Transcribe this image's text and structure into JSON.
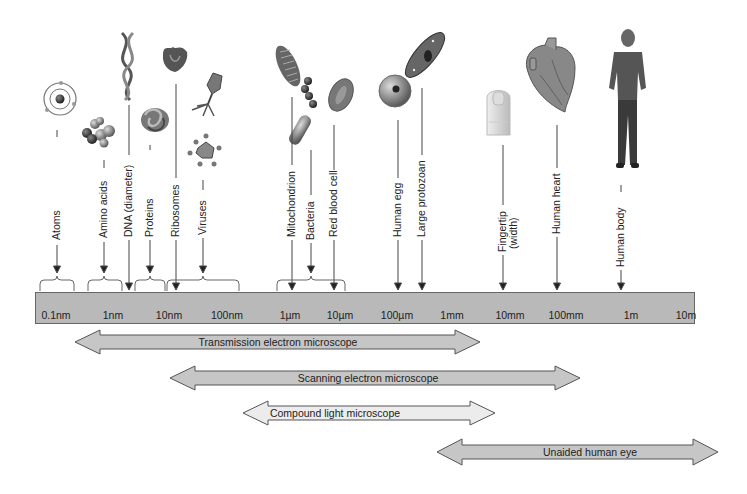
{
  "scale": {
    "ticks": [
      {
        "label": "0.1nm",
        "x": 56
      },
      {
        "label": "1nm",
        "x": 113
      },
      {
        "label": "10nm",
        "x": 169
      },
      {
        "label": "100nm",
        "x": 227
      },
      {
        "label": "1µm",
        "x": 290
      },
      {
        "label": "10µm",
        "x": 340
      },
      {
        "label": "100µm",
        "x": 397
      },
      {
        "label": "1mm",
        "x": 452
      },
      {
        "label": "10mm",
        "x": 510
      },
      {
        "label": "100mm",
        "x": 566
      },
      {
        "label": "1m",
        "x": 631
      },
      {
        "label": "10m",
        "x": 686
      }
    ]
  },
  "objects": [
    {
      "label": "Atoms",
      "icon": "atom-icon"
    },
    {
      "label": "Amino acids",
      "icon": "amino-acid-icon"
    },
    {
      "label": "DNA (diameter)",
      "icon": "dna-helix-icon"
    },
    {
      "label": "Proteins",
      "icon": "protein-icon"
    },
    {
      "label": "Ribosomes",
      "icon": "ribosome-icon"
    },
    {
      "label": "Viruses",
      "icon": "virus-icon"
    },
    {
      "label": "Mitochondrion",
      "icon": "mitochondrion-icon"
    },
    {
      "label": "Bacteria",
      "icon": "bacteria-icon"
    },
    {
      "label": "Red blood cell",
      "icon": "red-blood-cell-icon"
    },
    {
      "label": "Human egg",
      "icon": "human-egg-icon"
    },
    {
      "label": "Large protozoan",
      "icon": "protozoan-icon"
    },
    {
      "label": "Fingertip",
      "label2": "(width)",
      "icon": "fingertip-icon"
    },
    {
      "label": "Human heart",
      "icon": "heart-icon"
    },
    {
      "label": "Human body",
      "icon": "human-body-icon"
    }
  ],
  "ranges": [
    {
      "label": "Transmission electron microscope",
      "from": "0.1nm",
      "to": "1mm",
      "color": "#c6c6c6"
    },
    {
      "label": "Scanning electron microscope",
      "from": "10nm",
      "to": "100mm",
      "color": "#c6c6c6"
    },
    {
      "label": "Compound light microscope",
      "from": "100nm",
      "to": "10mm",
      "color": "#ececec"
    },
    {
      "label": "Unaided human eye",
      "from": "100µm",
      "to": "10m+",
      "color": "#c6c6c6"
    }
  ],
  "colors": {
    "scale_bar": "#b9b9b9",
    "arrow_fill_dark": "#c6c6c6",
    "arrow_fill_light": "#ececec",
    "outline": "#555555"
  }
}
